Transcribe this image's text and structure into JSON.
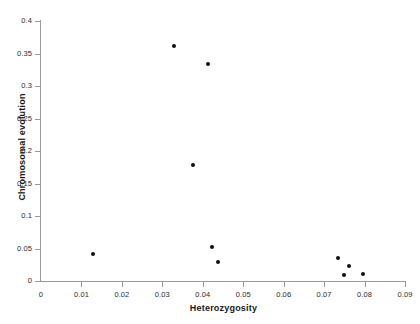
{
  "chart_data": {
    "type": "scatter",
    "title": "",
    "xlabel": "Heterozygosity",
    "ylabel": "Chromosomal evolution",
    "xlim": [
      0,
      0.09
    ],
    "ylim": [
      0,
      0.4
    ],
    "grid": false,
    "legend": null,
    "xticks": [
      "0",
      "0.01",
      "0.02",
      "0.03",
      "0.04",
      "0.05",
      "0.06",
      "0.07",
      "0.08",
      "0.09"
    ],
    "xtick_values": [
      0,
      0.01,
      0.02,
      0.03,
      0.04,
      0.05,
      0.06,
      0.07,
      0.08,
      0.09
    ],
    "yticks": [
      "0",
      "0.05",
      "0.1",
      "0.15",
      "0.2",
      "0.25",
      "0.3",
      "0.35",
      "0.4"
    ],
    "ytick_values": [
      0,
      0.05,
      0.1,
      0.15,
      0.2,
      0.25,
      0.3,
      0.35,
      0.4
    ],
    "marker": "filled-circle",
    "marker_color": "#101010",
    "points": [
      {
        "x": 0.0128,
        "y": 0.042
      },
      {
        "x": 0.0328,
        "y": 0.361
      },
      {
        "x": 0.0375,
        "y": 0.178
      },
      {
        "x": 0.0412,
        "y": 0.334
      },
      {
        "x": 0.0422,
        "y": 0.052
      },
      {
        "x": 0.0437,
        "y": 0.029
      },
      {
        "x": 0.0735,
        "y": 0.036
      },
      {
        "x": 0.0748,
        "y": 0.009
      },
      {
        "x": 0.0762,
        "y": 0.023
      },
      {
        "x": 0.0797,
        "y": 0.011
      }
    ]
  }
}
